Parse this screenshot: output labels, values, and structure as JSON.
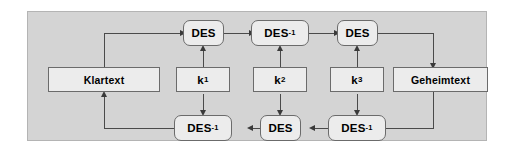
{
  "diagram": {
    "background_color": "#d4d4d4",
    "node_fill_color": "#ececec",
    "node_border_color": "#6b6b6b",
    "line_color": "#4a4a4a",
    "nodes": {
      "plaintext": {
        "label": "Klartext",
        "shape": "rectangle"
      },
      "ciphertext": {
        "label": "Geheimtext",
        "shape": "rectangle"
      },
      "key1": {
        "base": "k",
        "subscript": "1",
        "shape": "rectangle"
      },
      "key2": {
        "base": "k",
        "subscript": "2",
        "shape": "rectangle"
      },
      "key3": {
        "base": "k",
        "subscript": "3",
        "shape": "rectangle"
      },
      "enc1": {
        "base": "DES",
        "superscript": "",
        "shape": "rounded-rectangle"
      },
      "enc2": {
        "base": "DES",
        "superscript": "-1",
        "shape": "rounded-rectangle"
      },
      "enc3": {
        "base": "DES",
        "superscript": "",
        "shape": "rounded-rectangle"
      },
      "dec1": {
        "base": "DES",
        "superscript": "-1",
        "shape": "rounded-rectangle"
      },
      "dec2": {
        "base": "DES",
        "superscript": "",
        "shape": "rounded-rectangle"
      },
      "dec3": {
        "base": "DES",
        "superscript": "-1",
        "shape": "rounded-rectangle"
      }
    },
    "edges": [
      {
        "from": "plaintext",
        "to": "enc1",
        "direction": "up-right"
      },
      {
        "from": "enc1",
        "to": "enc2",
        "direction": "right"
      },
      {
        "from": "enc2",
        "to": "enc3",
        "direction": "right"
      },
      {
        "from": "enc3",
        "to": "ciphertext",
        "direction": "right-down"
      },
      {
        "from": "ciphertext",
        "to": "dec3",
        "direction": "down-left"
      },
      {
        "from": "dec3",
        "to": "dec2",
        "direction": "left"
      },
      {
        "from": "dec2",
        "to": "dec1",
        "direction": "left"
      },
      {
        "from": "dec1",
        "to": "plaintext",
        "direction": "left-up"
      },
      {
        "from": "key1",
        "to": "enc1",
        "direction": "up"
      },
      {
        "from": "key1",
        "to": "dec1",
        "direction": "down"
      },
      {
        "from": "key2",
        "to": "enc2",
        "direction": "up"
      },
      {
        "from": "key2",
        "to": "dec2",
        "direction": "down"
      },
      {
        "from": "key3",
        "to": "enc3",
        "direction": "up"
      },
      {
        "from": "key3",
        "to": "dec3",
        "direction": "down"
      }
    ]
  }
}
